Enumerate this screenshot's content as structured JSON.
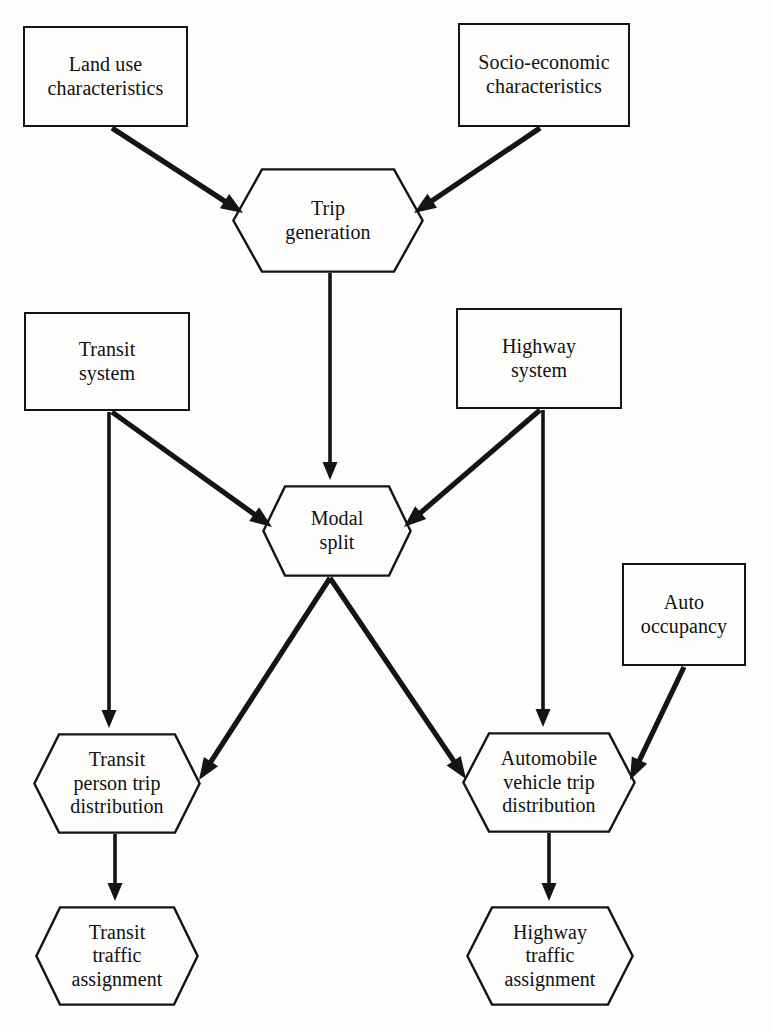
{
  "diagram": {
    "canvas": {
      "width": 772,
      "height": 1032
    },
    "stroke_color": "#141414",
    "background_color": "#fdfdfc",
    "nodes": [
      {
        "id": "land-use",
        "label": "Land use\ncharacteristics",
        "shape": "rectangle",
        "x": 23,
        "y": 26,
        "w": 165,
        "h": 101
      },
      {
        "id": "socio-economic",
        "label": "Socio-economic\ncharacteristics",
        "shape": "rectangle",
        "x": 458,
        "y": 23,
        "w": 172,
        "h": 104
      },
      {
        "id": "trip-generation",
        "label": "Trip\ngeneration",
        "shape": "hexagon",
        "x": 232,
        "y": 168,
        "w": 192,
        "h": 105
      },
      {
        "id": "transit-system",
        "label": "Transit\nsystem",
        "shape": "rectangle",
        "x": 24,
        "y": 312,
        "w": 166,
        "h": 99
      },
      {
        "id": "highway-system",
        "label": "Highway\nsystem",
        "shape": "rectangle",
        "x": 456,
        "y": 308,
        "w": 166,
        "h": 101
      },
      {
        "id": "modal-split",
        "label": "Modal\nsplit",
        "shape": "hexagon",
        "x": 262,
        "y": 485,
        "w": 150,
        "h": 92
      },
      {
        "id": "auto-occupancy",
        "label": "Auto\noccupancy",
        "shape": "rectangle",
        "x": 622,
        "y": 563,
        "w": 124,
        "h": 103
      },
      {
        "id": "transit-person-trip-distribution",
        "label": "Transit\nperson trip\ndistribution",
        "shape": "hexagon",
        "x": 33,
        "y": 733,
        "w": 168,
        "h": 101
      },
      {
        "id": "automobile-vehicle-trip-distribution",
        "label": "Automobile\nvehicle trip\ndistribution",
        "shape": "hexagon",
        "x": 462,
        "y": 732,
        "w": 174,
        "h": 101
      },
      {
        "id": "transit-traffic-assignment",
        "label": "Transit\ntraffic\nassignment",
        "shape": "hexagon",
        "x": 35,
        "y": 906,
        "w": 164,
        "h": 100
      },
      {
        "id": "highway-traffic-assignment",
        "label": "Highway\ntraffic\nassignment",
        "shape": "hexagon",
        "x": 466,
        "y": 906,
        "w": 168,
        "h": 100
      }
    ],
    "edges": [
      {
        "id": "land-use-to-trip-generation",
        "from": "land-use",
        "to": "trip-generation",
        "x1": 112,
        "y1": 128,
        "x2": 243,
        "y2": 213,
        "width": 5.2
      },
      {
        "id": "socio-economic-to-trip-generation",
        "from": "socio-economic",
        "to": "trip-generation",
        "x1": 540,
        "y1": 128,
        "x2": 414,
        "y2": 213,
        "width": 5.2
      },
      {
        "id": "trip-generation-to-modal-split",
        "from": "trip-generation",
        "to": "modal-split",
        "x1": 330,
        "y1": 273,
        "x2": 330,
        "y2": 480,
        "width": 3.6
      },
      {
        "id": "transit-system-to-modal-split",
        "from": "transit-system",
        "to": "modal-split",
        "x1": 112,
        "y1": 412,
        "x2": 272,
        "y2": 527,
        "width": 5.2
      },
      {
        "id": "transit-system-to-transit-person-trip-distribution",
        "from": "transit-system",
        "to": "transit-person-trip-distribution",
        "x1": 109,
        "y1": 412,
        "x2": 109,
        "y2": 728,
        "width": 3.6
      },
      {
        "id": "highway-system-to-modal-split",
        "from": "highway-system",
        "to": "modal-split",
        "x1": 540,
        "y1": 410,
        "x2": 404,
        "y2": 527,
        "width": 5.2
      },
      {
        "id": "highway-system-to-automobile-vehicle-trip-distribution",
        "from": "highway-system",
        "to": "automobile-vehicle-trip-distribution",
        "x1": 543,
        "y1": 410,
        "x2": 543,
        "y2": 727,
        "width": 3.6
      },
      {
        "id": "modal-split-to-transit-person-trip-distribution",
        "from": "modal-split",
        "to": "transit-person-trip-distribution",
        "x1": 330,
        "y1": 578,
        "x2": 199,
        "y2": 780,
        "width": 5.2
      },
      {
        "id": "modal-split-to-automobile-vehicle-trip-distribution",
        "from": "modal-split",
        "to": "automobile-vehicle-trip-distribution",
        "x1": 330,
        "y1": 578,
        "x2": 466,
        "y2": 779,
        "width": 5.2
      },
      {
        "id": "auto-occupancy-to-automobile-vehicle-trip-distribution",
        "from": "auto-occupancy",
        "to": "automobile-vehicle-trip-distribution",
        "x1": 684,
        "y1": 667,
        "x2": 630,
        "y2": 780,
        "width": 5.2
      },
      {
        "id": "transit-person-trip-distribution-to-transit-traffic-assignment",
        "from": "transit-person-trip-distribution",
        "to": "transit-traffic-assignment",
        "x1": 115,
        "y1": 834,
        "x2": 115,
        "y2": 901,
        "width": 3.6
      },
      {
        "id": "automobile-vehicle-trip-distribution-to-highway-traffic-assignment",
        "from": "automobile-vehicle-trip-distribution",
        "to": "highway-traffic-assignment",
        "x1": 549,
        "y1": 833,
        "x2": 549,
        "y2": 901,
        "width": 3.6
      }
    ]
  }
}
